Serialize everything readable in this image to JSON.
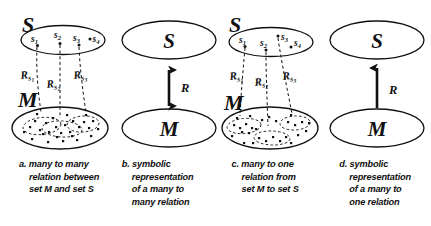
{
  "figure": {
    "background_color": "#ffffff",
    "ink_color": "#111111"
  },
  "panels": [
    {
      "id": "a",
      "kind": "detailed",
      "relation": "many-to-many",
      "top_set_label": "S",
      "bottom_set_label": "M",
      "elements": [
        "s1",
        "s2",
        "s3",
        "s4"
      ],
      "element_labels": [
        "s",
        "s",
        "s",
        "s"
      ],
      "element_subscripts": [
        "1",
        "2",
        "3",
        "4"
      ],
      "relation_labels": [
        "R",
        "R",
        "R"
      ],
      "relation_subscripts": [
        "s1",
        "s2",
        "s3"
      ],
      "region_style": "overlapping",
      "caption": {
        "marker": "a.",
        "lines": [
          "many to many",
          "relation between",
          "set M and set S"
        ]
      }
    },
    {
      "id": "b",
      "kind": "symbolic",
      "relation": "many-to-many",
      "top_set_label": "S",
      "bottom_set_label": "M",
      "arrow_label": "R",
      "arrow_direction": "double",
      "caption": {
        "marker": "b.",
        "lines": [
          "symbolic",
          "representation",
          "of a many to",
          "many relation"
        ]
      }
    },
    {
      "id": "c",
      "kind": "detailed",
      "relation": "many-to-one",
      "top_set_label": "S",
      "bottom_set_label": "M",
      "elements": [
        "s1",
        "s2",
        "s3",
        "s4"
      ],
      "element_labels": [
        "s",
        "s",
        "s",
        "s"
      ],
      "element_subscripts": [
        "1",
        "2",
        "3",
        "4"
      ],
      "relation_labels": [
        "R",
        "R",
        "R"
      ],
      "relation_subscripts": [
        "s1",
        "s2",
        "s3"
      ],
      "region_style": "disjoint",
      "caption": {
        "marker": "c.",
        "lines": [
          "many to one",
          "relation from",
          "set M to set S"
        ]
      }
    },
    {
      "id": "d",
      "kind": "symbolic",
      "relation": "many-to-one",
      "top_set_label": "S",
      "bottom_set_label": "M",
      "arrow_label": "R",
      "arrow_direction": "up",
      "caption": {
        "marker": "d.",
        "lines": [
          "symbolic",
          "representation",
          "of a many to",
          "one relation"
        ]
      }
    }
  ]
}
